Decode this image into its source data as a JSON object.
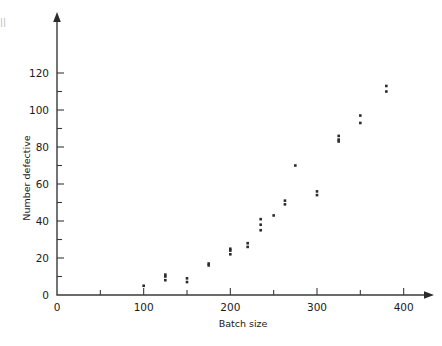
{
  "figure": {
    "background_color": "#ffffff",
    "axis_color": "#3a3a3a",
    "point_color": "#2b2b2b",
    "edge_margin_fragment": "|||"
  },
  "chart_data": {
    "type": "scatter",
    "title": "",
    "subtitle": "",
    "xlabel": "Batch size",
    "ylabel": "Number defective",
    "xlim": [
      0,
      430
    ],
    "ylim": [
      0,
      130
    ],
    "xticks": [
      0,
      100,
      200,
      300,
      400
    ],
    "xticklabels": [
      "0",
      "100",
      "200",
      "300",
      "400"
    ],
    "xminorticks": [
      50,
      150,
      250,
      350
    ],
    "yticks": [
      0,
      20,
      40,
      60,
      80,
      100,
      120
    ],
    "yticklabels": [
      "0",
      "20",
      "40",
      "60",
      "80",
      "100",
      "120"
    ],
    "yminorticks": [
      10,
      30,
      50,
      70,
      90,
      110
    ],
    "grid": false,
    "legend": false,
    "legend_position": "none",
    "axis_style": "arrowed-spines",
    "marker": "square",
    "marker_size_px": 2.6,
    "points": [
      {
        "x": 100,
        "y": 5
      },
      {
        "x": 125,
        "y": 8
      },
      {
        "x": 125,
        "y": 10
      },
      {
        "x": 125,
        "y": 11
      },
      {
        "x": 150,
        "y": 7
      },
      {
        "x": 150,
        "y": 9
      },
      {
        "x": 175,
        "y": 16
      },
      {
        "x": 175,
        "y": 17
      },
      {
        "x": 200,
        "y": 22
      },
      {
        "x": 200,
        "y": 24
      },
      {
        "x": 200,
        "y": 25
      },
      {
        "x": 220,
        "y": 26
      },
      {
        "x": 220,
        "y": 28
      },
      {
        "x": 235,
        "y": 35
      },
      {
        "x": 235,
        "y": 38
      },
      {
        "x": 235,
        "y": 41
      },
      {
        "x": 250,
        "y": 43
      },
      {
        "x": 263,
        "y": 49
      },
      {
        "x": 263,
        "y": 51
      },
      {
        "x": 275,
        "y": 70
      },
      {
        "x": 300,
        "y": 54
      },
      {
        "x": 300,
        "y": 56
      },
      {
        "x": 325,
        "y": 83
      },
      {
        "x": 325,
        "y": 84
      },
      {
        "x": 325,
        "y": 86
      },
      {
        "x": 350,
        "y": 93
      },
      {
        "x": 350,
        "y": 97
      },
      {
        "x": 380,
        "y": 110
      },
      {
        "x": 380,
        "y": 113
      }
    ]
  }
}
